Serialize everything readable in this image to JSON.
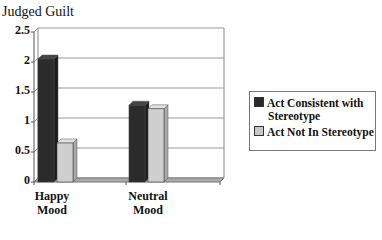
{
  "chart": {
    "ylabel": "Judged Guilt",
    "yticks": [
      "2.5",
      "2",
      "1.5",
      "1",
      "0.5",
      "0"
    ],
    "categories": [
      "Happy\nMood",
      "Neutral\nMood"
    ],
    "category_lines": [
      [
        "Happy",
        "Mood"
      ],
      [
        "Neutral",
        "Mood"
      ]
    ],
    "legend": [
      {
        "label_lines": [
          "Act Consistent with",
          "Stereotype"
        ],
        "color": "#2b2b2b"
      },
      {
        "label_lines": [
          "Act Not In Stereotype"
        ],
        "color": "#c8c8c8"
      }
    ]
  },
  "chart_data": {
    "type": "bar",
    "title": "",
    "xlabel": "",
    "ylabel": "Judged Guilt",
    "categories": [
      "Happy Mood",
      "Neutral Mood"
    ],
    "series": [
      {
        "name": "Act Consistent with Stereotype",
        "values": [
          2.05,
          1.28
        ]
      },
      {
        "name": "Act Not In Stereotype",
        "values": [
          0.65,
          1.22
        ]
      }
    ],
    "ylim": [
      0,
      2.5
    ],
    "yticks": [
      0,
      0.5,
      1,
      1.5,
      2,
      2.5
    ],
    "grid": true,
    "legend_position": "right",
    "style": "3d"
  }
}
